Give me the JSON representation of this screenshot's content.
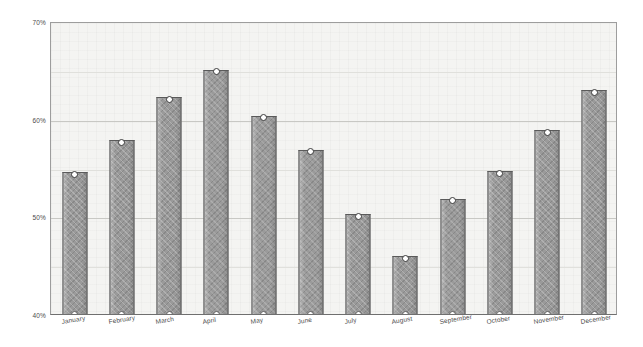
{
  "chart_data": {
    "type": "bar",
    "title": "",
    "subtitle": "",
    "xlabel": "",
    "ylabel": "",
    "categories": [
      "January",
      "February",
      "March",
      "April",
      "May",
      "June",
      "July",
      "August",
      "September",
      "October",
      "November",
      "December"
    ],
    "values": [
      54.5,
      57.8,
      62.2,
      65.0,
      60.3,
      56.8,
      50.2,
      45.9,
      51.8,
      54.6,
      58.8,
      62.9
    ],
    "series": [
      {
        "name": "Monthly percentage",
        "values": [
          54.5,
          57.8,
          62.2,
          65.0,
          60.3,
          56.8,
          50.2,
          45.9,
          51.8,
          54.6,
          58.8,
          62.9
        ]
      }
    ],
    "ylim": [
      40,
      70
    ],
    "xlim": [
      0,
      12
    ],
    "y_ticks": [
      40,
      50,
      60,
      70
    ],
    "y_tick_labels": [
      "40%",
      "50%",
      "60%",
      "70%"
    ],
    "y_minor_ticks": [
      45,
      55,
      65
    ],
    "grid": true,
    "grid_axis": "y",
    "legend": false,
    "legend_position": "none",
    "value_unit": "%",
    "markers": "open-circle",
    "bar_fill_pattern": "crosshatch",
    "annotations": []
  },
  "style": {
    "bar_color": "#9a9a9a",
    "bar_border_color": "#5a5a5a",
    "marker_fill": "#ffffff",
    "marker_stroke": "#3b3b3b",
    "plot_background": "#f4f4f2",
    "gridline_color": "#c8c8c4",
    "axis_color": "#6f6f6f",
    "text_color": "#4b4b4b",
    "page_background": "#ffffff"
  }
}
